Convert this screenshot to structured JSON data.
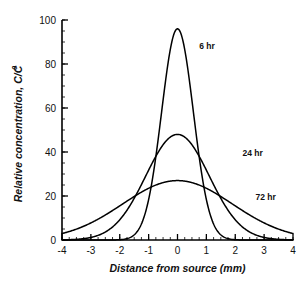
{
  "chart_data": {
    "type": "line",
    "title": "",
    "xlabel": "Distance from source (mm)",
    "ylabel": "Relative concentration, C/C",
    "ylabel_subscript": "0",
    "xlim": [
      -4,
      4
    ],
    "ylim": [
      0,
      100
    ],
    "grid": false,
    "legend": "inline-annotations",
    "xticks": [
      -4,
      -3,
      -2,
      -1,
      0,
      1,
      2,
      3,
      4
    ],
    "xtick_labels": [
      "-4",
      "-3",
      "-2",
      "-1",
      "0",
      "1",
      "2",
      "3",
      "4"
    ],
    "yticks": [
      0,
      20,
      40,
      60,
      80,
      100
    ],
    "ytick_labels": [
      "0",
      "20",
      "40",
      "60",
      "80",
      "100"
    ],
    "x_minor_step": 0.25,
    "y_minor_step": 5,
    "series": [
      {
        "name": "6 hr",
        "label": "6 hr",
        "peak": 96,
        "sigma": 0.55,
        "color": "#000000",
        "x": [
          -4,
          -3.5,
          -3,
          -2.5,
          -2,
          -1.75,
          -1.5,
          -1.25,
          -1,
          -0.75,
          -0.5,
          -0.25,
          0,
          0.25,
          0.5,
          0.75,
          1,
          1.25,
          1.5,
          1.75,
          2,
          2.5,
          3,
          3.5,
          4
        ],
        "values": [
          0,
          0,
          0,
          0.1,
          0.6,
          1.7,
          4.2,
          9.3,
          18.3,
          31.8,
          49.5,
          68.9,
          85.5,
          93.5,
          89,
          73.5,
          54.3,
          35.6,
          20.7,
          10.7,
          4.9,
          0.7,
          0.1,
          0,
          0
        ]
      },
      {
        "name": "24 hr",
        "label": "24 hr",
        "peak": 48,
        "sigma": 1.1,
        "color": "#000000",
        "x": [
          -4,
          -3.5,
          -3,
          -2.5,
          -2,
          -1.75,
          -1.5,
          -1.25,
          -1,
          -0.75,
          -0.5,
          -0.25,
          0,
          0.25,
          0.5,
          0.75,
          1,
          1.25,
          1.5,
          1.75,
          2,
          2.5,
          3,
          3.5,
          4
        ],
        "values": [
          1.1,
          2.5,
          5.2,
          9.8,
          16.6,
          20.7,
          25.1,
          29.6,
          34.0,
          38.0,
          41.4,
          43.9,
          45.4,
          45.9,
          45.2,
          43.4,
          40.6,
          36.9,
          32.6,
          28.0,
          23.3,
          15.1,
          8.6,
          4.3,
          1.9
        ]
      },
      {
        "name": "72 hr",
        "label": "72 hr",
        "peak": 27,
        "sigma": 1.9,
        "color": "#000000",
        "x": [
          -4,
          -3.5,
          -3,
          -2.5,
          -2,
          -1.75,
          -1.5,
          -1.25,
          -1,
          -0.75,
          -0.5,
          -0.25,
          0,
          0.25,
          0.5,
          0.75,
          1,
          1.25,
          1.5,
          1.75,
          2,
          2.5,
          3,
          3.5,
          4
        ],
        "values": [
          6.0,
          8.6,
          11.7,
          15.0,
          18.4,
          20.0,
          21.5,
          22.8,
          24.0,
          25.0,
          25.8,
          26.3,
          26.6,
          26.7,
          26.5,
          26.0,
          25.3,
          24.3,
          23.1,
          21.8,
          20.3,
          17.1,
          13.7,
          10.4,
          7.5
        ]
      }
    ],
    "annotations": [
      {
        "text": "6 hr",
        "x": 0.75,
        "y": 87
      },
      {
        "text": "24 hr",
        "x": 2.25,
        "y": 38
      },
      {
        "text": "72 hr",
        "x": 2.7,
        "y": 18
      }
    ]
  }
}
